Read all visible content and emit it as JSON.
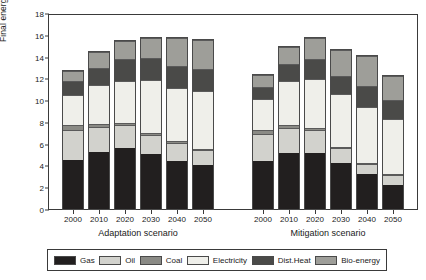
{
  "chart_data": {
    "type": "bar",
    "title": "",
    "subtitle": "",
    "stacked": true,
    "xlabel": "",
    "ylabel": "Final energy demand (EJ)",
    "ylim": [
      0,
      18
    ],
    "yticks": [
      0,
      2,
      4,
      6,
      8,
      10,
      12,
      14,
      16,
      18
    ],
    "ytick_labels": [
      "0",
      "2",
      "4",
      "6",
      "8",
      "10",
      "12",
      "14",
      "16",
      "18"
    ],
    "grid": false,
    "legend_position": "bottom",
    "categories": [
      "2000",
      "2010",
      "2020",
      "2030",
      "2040",
      "2050"
    ],
    "groups": [
      {
        "name": "Adaptation scenario",
        "key": "adaptation"
      },
      {
        "name": "Mitigation scenario",
        "key": "mitigation"
      }
    ],
    "series": [
      {
        "name": "Gas",
        "color": "#221f1f",
        "adaptation": [
          4.6,
          5.3,
          5.7,
          5.1,
          4.5,
          4.1
        ],
        "mitigation": [
          4.5,
          5.2,
          5.2,
          4.3,
          3.3,
          2.2
        ]
      },
      {
        "name": "Oil",
        "color": "#d2d2cd",
        "adaptation": [
          2.8,
          2.3,
          2.1,
          1.8,
          1.6,
          1.4
        ],
        "mitigation": [
          2.5,
          2.3,
          2.1,
          1.4,
          0.9,
          1.0
        ]
      },
      {
        "name": "Coal",
        "color": "#8a8a85",
        "adaptation": [
          0.4,
          0.3,
          0.2,
          0.2,
          0.2,
          0.1
        ],
        "mitigation": [
          0.4,
          0.3,
          0.2,
          0.1,
          0.1,
          0.1
        ]
      },
      {
        "name": "Electricity",
        "color": "#efefea",
        "adaptation": [
          2.8,
          3.6,
          3.9,
          4.9,
          4.9,
          5.4
        ],
        "mitigation": [
          2.9,
          4.1,
          4.6,
          4.9,
          5.2,
          5.1
        ]
      },
      {
        "name": "Dist.Heat",
        "color": "#4a4a48",
        "adaptation": [
          1.3,
          1.6,
          2.0,
          2.0,
          2.1,
          2.0
        ],
        "mitigation": [
          1.1,
          1.6,
          1.8,
          1.7,
          1.9,
          1.8
        ]
      },
      {
        "name": "Bio-energy",
        "color": "#9e9e99",
        "adaptation": [
          1.0,
          1.5,
          1.7,
          1.9,
          2.6,
          2.7
        ],
        "mitigation": [
          1.1,
          1.6,
          2.0,
          2.4,
          2.8,
          2.2
        ]
      }
    ],
    "totals": {
      "adaptation": [
        12.9,
        14.6,
        15.6,
        15.9,
        15.9,
        15.7
      ],
      "mitigation": [
        12.5,
        15.1,
        15.9,
        14.8,
        14.2,
        12.4
      ]
    }
  },
  "axis": {
    "y_title": "Final energy demand (EJ)"
  },
  "legend": {
    "items": [
      {
        "label": "Gas",
        "color": "#221f1f"
      },
      {
        "label": "Oil",
        "color": "#d2d2cd"
      },
      {
        "label": "Coal",
        "color": "#8a8a85"
      },
      {
        "label": "Electricity",
        "color": "#efefea"
      },
      {
        "label": "Dist.Heat",
        "color": "#4a4a48"
      },
      {
        "label": "Bio-energy",
        "color": "#9e9e99"
      }
    ]
  }
}
